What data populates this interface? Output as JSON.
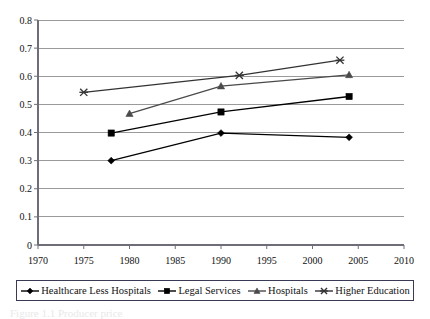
{
  "chart_data": {
    "type": "line",
    "title": "",
    "xlabel": "",
    "ylabel": "",
    "xlim": [
      1970,
      2010
    ],
    "ylim": [
      0,
      0.8
    ],
    "xticks": [
      1970,
      1975,
      1980,
      1985,
      1990,
      1995,
      2000,
      2005,
      2010
    ],
    "yticks": [
      "0",
      "0.1",
      "0.2",
      "0.3",
      "0.4",
      "0.5",
      "0.6",
      "0.7",
      "0.8"
    ],
    "grid": true,
    "legend_position": "bottom",
    "series": [
      {
        "name": "Healthcare Less Hospitals",
        "marker": "diamond",
        "color": "#000000",
        "points": [
          {
            "x": 1978,
            "y": 0.3
          },
          {
            "x": 1990,
            "y": 0.398
          },
          {
            "x": 2004,
            "y": 0.383
          }
        ]
      },
      {
        "name": "Legal Services",
        "marker": "square",
        "color": "#000000",
        "points": [
          {
            "x": 1978,
            "y": 0.398
          },
          {
            "x": 1990,
            "y": 0.473
          },
          {
            "x": 2004,
            "y": 0.528
          }
        ]
      },
      {
        "name": "Hospitals",
        "marker": "triangle",
        "color": "#4a4a4a",
        "points": [
          {
            "x": 1980,
            "y": 0.467
          },
          {
            "x": 1990,
            "y": 0.565
          },
          {
            "x": 2004,
            "y": 0.605
          }
        ]
      },
      {
        "name": "Higher Education",
        "marker": "star",
        "color": "#333333",
        "points": [
          {
            "x": 1975,
            "y": 0.543
          },
          {
            "x": 1992,
            "y": 0.603
          },
          {
            "x": 2003,
            "y": 0.657
          }
        ]
      }
    ]
  },
  "legend": {
    "items": [
      {
        "label": "Healthcare Less Hospitals",
        "marker": "diamond"
      },
      {
        "label": "Legal Services",
        "marker": "square"
      },
      {
        "label": "Hospitals",
        "marker": "triangle"
      },
      {
        "label": "Higher Education",
        "marker": "star"
      }
    ]
  },
  "caption": {
    "text": "Figure 1.1  Producer price"
  },
  "colors": {
    "grid": "#9a9a9a",
    "axis": "#6e6e78",
    "text": "#111111",
    "legend_border": "#3a3a55"
  }
}
